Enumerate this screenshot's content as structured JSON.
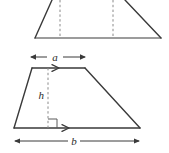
{
  "figure": {
    "colors": {
      "stroke": "#3a3a3a",
      "dashed": "#8a8a8a",
      "label": "#2b2b2b",
      "background": "#ffffff"
    },
    "labels": {
      "top_side": "a",
      "bottom_side": "b",
      "height": "h"
    },
    "upper_shape": {
      "name": "trapezoid-cropped",
      "vertices": "cropped at top edge; base from x=35 to x=161 at y=38",
      "dashed_lines": [
        {
          "x": 60,
          "y1": 0,
          "y2": 38
        },
        {
          "x": 113,
          "y1": 0,
          "y2": 38
        }
      ]
    },
    "lower_shape": {
      "name": "trapezoid-labelled",
      "top_left": "32,68",
      "top_right": "85,68",
      "bottom_left": "14,128",
      "bottom_right": "140,128",
      "height_line": {
        "x": 48,
        "y1": 68,
        "y2": 128
      },
      "right_angle_marker": true,
      "parallel_marks": 1
    },
    "dimension_a": {
      "x1": 30,
      "x2": 86,
      "y": 57,
      "arrows": "both"
    },
    "dimension_b": {
      "x1": 14,
      "x2": 140,
      "y": 141,
      "arrows": "both"
    }
  }
}
